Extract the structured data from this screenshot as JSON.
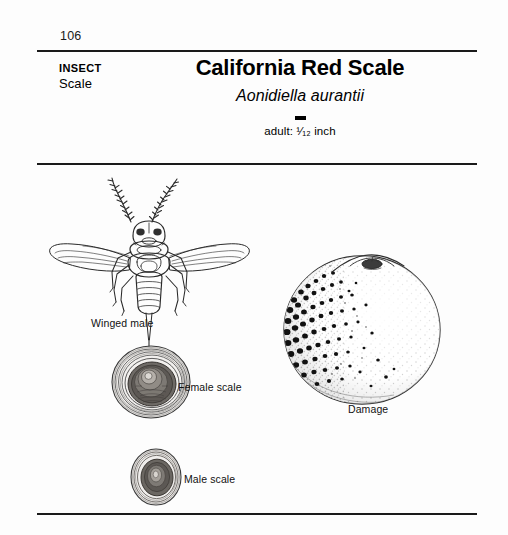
{
  "page": {
    "folio": "106",
    "background_color": "#fdfdfd",
    "rule_color": "#1a1a1a"
  },
  "header": {
    "category_kind": "INSECT",
    "category_name": "Scale",
    "common_name": "California Red Scale",
    "scientific_name": "Aonidiella aurantii",
    "size_label": "adult: ¹⁄₁₂ inch",
    "size_prefix": "adult:",
    "size_fraction": "¹⁄₁₂",
    "size_unit": "inch"
  },
  "figures": [
    {
      "id": "winged-male",
      "caption": "Winged male",
      "kind": "line-drawing-insect"
    },
    {
      "id": "female-scale",
      "caption": "Female scale",
      "kind": "concentric-circular-scale"
    },
    {
      "id": "male-scale",
      "caption": "Male scale",
      "kind": "concentric-oval-scale"
    },
    {
      "id": "damage",
      "caption": "Damage",
      "kind": "citrus-fruit-with-scale-spots"
    }
  ]
}
